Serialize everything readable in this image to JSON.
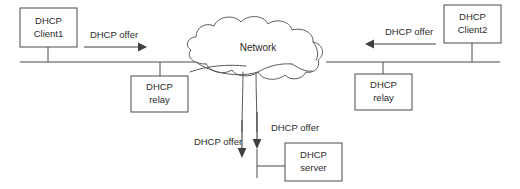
{
  "diagram": {
    "stroke_color": "#4a4a4a",
    "text_color": "#2b2b2b",
    "background": "#ffffff",
    "cloud": {
      "label": "Network"
    },
    "nodes": [
      {
        "id": "client1",
        "line1": "DHCP",
        "line2": "Client1"
      },
      {
        "id": "relay_left",
        "line1": "DHCP",
        "line2": "relay"
      },
      {
        "id": "client2",
        "line1": "DHCP",
        "line2": "Client2"
      },
      {
        "id": "relay_right",
        "line1": "DHCP",
        "line2": "relay"
      },
      {
        "id": "server",
        "line1": "DHCP",
        "line2": "server"
      }
    ],
    "flows": [
      {
        "id": "offer-left-top",
        "label": "DHCP offer",
        "direction": "right"
      },
      {
        "id": "offer-right-top",
        "label": "DHCP offer",
        "direction": "left"
      },
      {
        "id": "offer-server-left",
        "label": "DHCP offer",
        "direction": "down"
      },
      {
        "id": "offer-server-right",
        "label": "DHCP offer",
        "direction": "down"
      }
    ]
  }
}
